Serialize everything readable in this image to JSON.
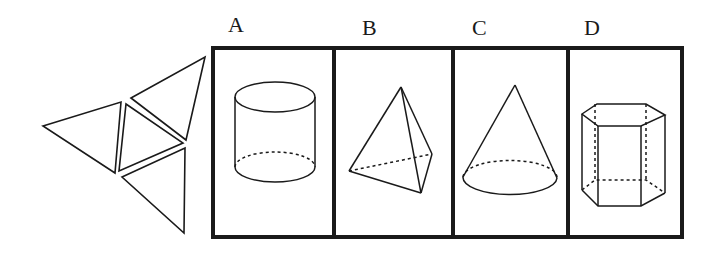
{
  "question": {
    "net": {
      "description": "Unfolded net of four triangles",
      "pieces": 4
    },
    "options": [
      {
        "letter": "A",
        "shape": "cylinder"
      },
      {
        "letter": "B",
        "shape": "triangular pyramid (tetrahedron)"
      },
      {
        "letter": "C",
        "shape": "cone"
      },
      {
        "letter": "D",
        "shape": "hexagonal prism"
      }
    ]
  },
  "colors": {
    "stroke": "#1a1a1a",
    "background": "#ffffff"
  }
}
